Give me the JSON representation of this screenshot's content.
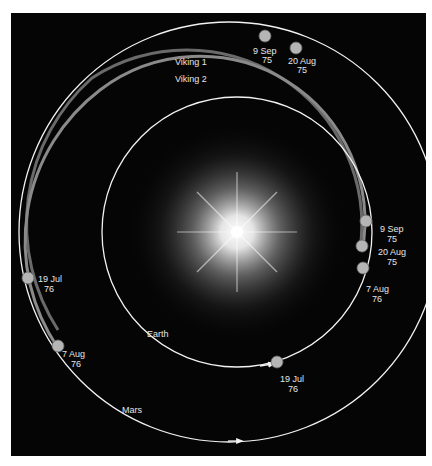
{
  "diagram": {
    "colors": {
      "background": "#050505",
      "orbit": "#f2f2f2",
      "trajectory": "#7a7a7a",
      "sun": "#ffffff",
      "planet": "#b5b5b5"
    },
    "orbits": [
      {
        "name": "Earth",
        "label": "Earth"
      },
      {
        "name": "Mars",
        "label": "Mars"
      }
    ],
    "trajectories": [
      {
        "name": "Viking 1",
        "label": "Viking 1"
      },
      {
        "name": "Viking 2",
        "label": "Viking 2"
      }
    ],
    "earth_positions": [
      {
        "date": "20 Aug",
        "year": "75"
      },
      {
        "date": "9 Sep",
        "year": "75"
      },
      {
        "date": "7 Aug",
        "year": "76"
      },
      {
        "date": "19 Jul",
        "year": "76"
      }
    ],
    "mars_positions": [
      {
        "date": "9 Sep",
        "year": "75"
      },
      {
        "date": "20 Aug",
        "year": "75"
      },
      {
        "date": "19 Jul",
        "year": "76"
      },
      {
        "date": "7 Aug",
        "year": "76"
      }
    ]
  }
}
